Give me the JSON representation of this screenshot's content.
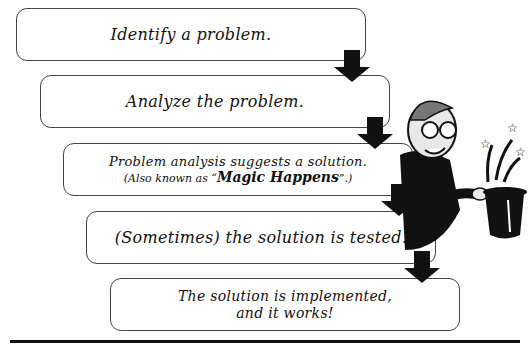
{
  "diagram": {
    "steps": [
      {
        "text": "Identify a problem."
      },
      {
        "text": "Analyze the problem."
      },
      {
        "text": "Problem analysis suggests a solution.",
        "subtext_prefix": "(Also known as “",
        "subtext_emphasis": "Magic Happens",
        "subtext_suffix": "”.)"
      },
      {
        "text": "(Sometimes) the solution is tested."
      },
      {
        "text_line1": "The solution is implemented,",
        "text_line2": "and it works!"
      }
    ],
    "illustration": "magician-with-top-hat",
    "colors": {
      "stroke": "#444444",
      "arrow": "#111111",
      "background": "#fdfdfd"
    }
  }
}
